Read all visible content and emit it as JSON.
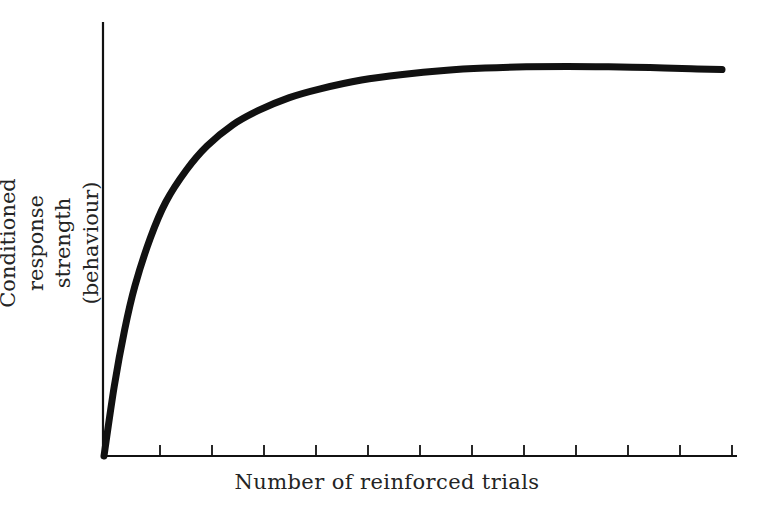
{
  "figure": {
    "background_color": "#ffffff",
    "ink_color": "#111111",
    "text_color": "#242424"
  },
  "axes": {
    "y_label_line1": "Conditioned response strength",
    "y_label_line2": "(behaviour)",
    "x_label": "Number of reinforced trials",
    "x_tick_count": 12,
    "y_tick_count": 0
  },
  "chart_data": {
    "type": "line",
    "title": "",
    "subtitle": "",
    "xlabel": "Number of reinforced trials",
    "ylabel": "Conditioned response strength (behaviour)",
    "xlim": [
      0,
      12
    ],
    "ylim": [
      0,
      1
    ],
    "grid": false,
    "legend": "none",
    "xticks": [
      1,
      2,
      3,
      4,
      5,
      6,
      7,
      8,
      9,
      10,
      11,
      12
    ],
    "xticklabels": [
      "",
      "",
      "",
      "",
      "",
      "",
      "",
      "",
      "",
      "",
      "",
      ""
    ],
    "yticks": [],
    "yticklabels": [],
    "annotations": [],
    "series": [
      {
        "name": "Acquisition curve",
        "description": "Negatively accelerated learning curve rising steeply then approaching asymptote with slight late decline",
        "x": [
          0.0,
          0.2,
          0.4,
          0.6,
          0.9,
          1.2,
          1.6,
          2.0,
          2.5,
          3.0,
          3.6,
          4.2,
          5.0,
          5.8,
          6.6,
          7.4,
          8.2,
          9.0,
          9.8,
          10.6,
          11.4,
          12.0
        ],
        "y": [
          0.0,
          0.175,
          0.315,
          0.425,
          0.545,
          0.635,
          0.715,
          0.775,
          0.828,
          0.864,
          0.896,
          0.918,
          0.94,
          0.954,
          0.964,
          0.97,
          0.973,
          0.974,
          0.973,
          0.971,
          0.968,
          0.966
        ]
      }
    ]
  }
}
